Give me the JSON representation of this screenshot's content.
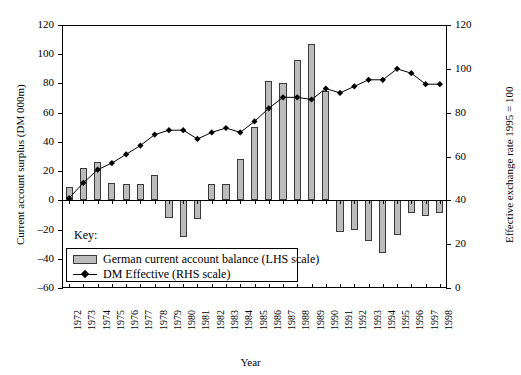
{
  "chart_data": {
    "type": "bar",
    "title": "",
    "xlabel": "Year",
    "ylabel": "Current account surplus (DM 000m)",
    "y2label": "Effective exchange rate 1995 = 100",
    "categories": [
      "1972",
      "1973",
      "1974",
      "1975",
      "1976",
      "1977",
      "1978",
      "1979",
      "1980",
      "1981",
      "1982",
      "1983",
      "1984",
      "1985",
      "1986",
      "1987",
      "1988",
      "1989",
      "1990",
      "1991",
      "1992",
      "1993",
      "1994",
      "1995",
      "1996",
      "1997",
      "1998"
    ],
    "ylim": [
      -60,
      120
    ],
    "y2lim": [
      0,
      120
    ],
    "yticks": [
      120,
      100,
      80,
      60,
      40,
      20,
      0,
      -20,
      -40,
      -60
    ],
    "ytick_labels": [
      "120",
      "100",
      "80",
      "60",
      "40",
      "20",
      "0",
      "–20",
      "–40",
      "–60"
    ],
    "y2ticks": [
      120,
      100,
      80,
      60,
      40,
      20,
      0
    ],
    "y2tick_labels": [
      "120",
      "100",
      "80",
      "60",
      "40",
      "20",
      "0"
    ],
    "grid": false,
    "legend_position": "inside-lower-left",
    "series": [
      {
        "name": "German current account balance (LHS scale)",
        "type": "bar",
        "axis": "left",
        "color": "#bcbcbc",
        "edge_color": "#3a3a3a",
        "values": [
          9,
          22,
          26,
          12,
          11,
          11,
          17,
          -12,
          -25,
          -13,
          11,
          11,
          28,
          50,
          82,
          80,
          96,
          107,
          75,
          -22,
          -20,
          -28,
          -36,
          -24,
          -9,
          -11,
          -9
        ]
      },
      {
        "name": "DM Effective (RHS scale)",
        "type": "line",
        "axis": "right",
        "color": "#000000",
        "marker": "diamond",
        "values": [
          41,
          48,
          54,
          57,
          61,
          65,
          70,
          72,
          72,
          68,
          71,
          73,
          71,
          76,
          82,
          87,
          87,
          86,
          91,
          89,
          92,
          95,
          95,
          100,
          98,
          93,
          93
        ]
      }
    ]
  },
  "axes": {
    "left_title": "Current account surplus (DM 000m)",
    "right_title": "Effective exchange rate 1995 = 100",
    "x_title": "Year"
  },
  "key": {
    "label": "Key:",
    "items": [
      {
        "label": "German current account balance (LHS scale)",
        "icon": "bar-swatch"
      },
      {
        "label": "DM Effective (RHS scale)",
        "icon": "line-marker-swatch"
      }
    ]
  }
}
